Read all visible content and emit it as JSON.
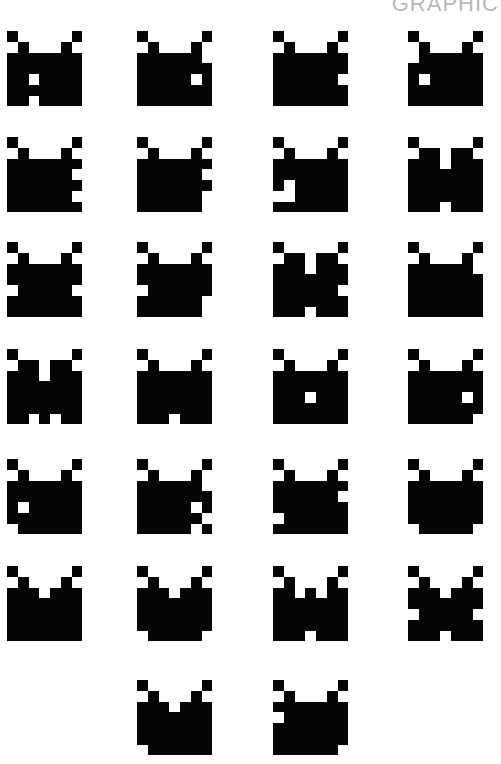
{
  "header": {
    "label": "GRAPHIC"
  },
  "colors": {
    "ink": "#050505",
    "background": "#ffffff",
    "label": "#b8b8b8"
  },
  "grid": {
    "cell_px": 10.75,
    "cols_x": [
      7,
      137,
      273,
      408
    ],
    "rows_y": [
      31,
      137,
      242,
      349,
      459,
      566,
      680
    ]
  },
  "sprites": [
    {
      "row": 0,
      "col": 0,
      "pattern": [
        "#.....#",
        ".#...#.",
        "#######",
        "#######",
        "##.####",
        "#######",
        "##.####"
      ]
    },
    {
      "row": 0,
      "col": 1,
      "pattern": [
        "#.....#",
        ".#...#.",
        "######.",
        "#######",
        "#####.#",
        "#######",
        "#######"
      ]
    },
    {
      "row": 0,
      "col": 2,
      "pattern": [
        "#.....#",
        ".#...#.",
        "#######",
        "#######",
        "######.",
        "#######",
        "#######"
      ]
    },
    {
      "row": 0,
      "col": 3,
      "pattern": [
        "#.....#",
        ".#...#.",
        ".######",
        "#######",
        "#.#####",
        "#######",
        "#######"
      ]
    },
    {
      "row": 1,
      "col": 0,
      "pattern": [
        "#.....#",
        ".#...#.",
        "#######",
        "######.",
        "#######",
        "######.",
        "#######"
      ]
    },
    {
      "row": 1,
      "col": 1,
      "pattern": [
        "#.....#",
        ".#...#.",
        "#######",
        "######.",
        "#######",
        "######.",
        "######."
      ]
    },
    {
      "row": 1,
      "col": 2,
      "pattern": [
        "#.....#",
        ".#...#.",
        "#######",
        "#######",
        "#.#####",
        "..#####",
        "#######"
      ]
    },
    {
      "row": 1,
      "col": 3,
      "pattern": [
        "#.....#",
        ".##.##.",
        "###.###",
        "#######",
        "#######",
        "#######",
        "###.###"
      ]
    },
    {
      "row": 2,
      "col": 0,
      "pattern": [
        "#.....#",
        ".#...#.",
        "#######",
        "#######",
        ".#####.",
        "#######",
        "#######"
      ]
    },
    {
      "row": 2,
      "col": 1,
      "pattern": [
        "#.....#",
        ".#...#.",
        "#######",
        "#######",
        ".######",
        "######.",
        "######."
      ]
    },
    {
      "row": 2,
      "col": 2,
      "pattern": [
        "#.....#",
        ".##.##.",
        "###.###",
        "#######",
        "######.",
        "#######",
        "###.###"
      ]
    },
    {
      "row": 2,
      "col": 3,
      "pattern": [
        "#.....#",
        ".#...#.",
        "######.",
        "#######",
        "#######",
        "#######",
        "#######"
      ]
    },
    {
      "row": 3,
      "col": 0,
      "pattern": [
        "#.....#",
        ".##.##.",
        "###.###",
        "#######",
        "#######",
        "#######",
        "##.#.##"
      ]
    },
    {
      "row": 3,
      "col": 1,
      "pattern": [
        "#.....#",
        ".#...#.",
        "#######",
        "#######",
        "#######",
        "#######",
        "###.###"
      ]
    },
    {
      "row": 3,
      "col": 2,
      "pattern": [
        "#.....#",
        ".#...#.",
        "#######",
        "#######",
        "###.###",
        "#######",
        "#######"
      ]
    },
    {
      "row": 3,
      "col": 3,
      "pattern": [
        "#.....#",
        ".#...#.",
        "#######",
        "#######",
        "#####.#",
        "#######",
        "######."
      ]
    },
    {
      "row": 4,
      "col": 0,
      "pattern": [
        "#.....#",
        ".#...#.",
        "#######",
        "#######",
        "#.#####",
        "#######",
        ".######"
      ]
    },
    {
      "row": 4,
      "col": 1,
      "pattern": [
        "#.....#",
        ".#...#.",
        "######.",
        "#######",
        "#####.#",
        "######.",
        "#####.#"
      ]
    },
    {
      "row": 4,
      "col": 2,
      "pattern": [
        "#.....#",
        ".#...#.",
        "#######",
        "######.",
        "#######",
        ".######",
        "#######"
      ]
    },
    {
      "row": 4,
      "col": 3,
      "pattern": [
        "#.....#",
        ".#...#.",
        "#######",
        "#######",
        "#######",
        "#######",
        ".#####."
      ]
    },
    {
      "row": 5,
      "col": 0,
      "pattern": [
        "#.....#",
        ".#...#.",
        "###.###",
        "#######",
        "#######",
        "#######",
        "#######"
      ]
    },
    {
      "row": 5,
      "col": 1,
      "pattern": [
        "#.....#",
        ".#...#.",
        "###.###",
        "#######",
        "#######",
        "#######",
        ".#####."
      ]
    },
    {
      "row": 5,
      "col": 2,
      "pattern": [
        "#.....#",
        ".#...#.",
        "##.#.##",
        "#######",
        "#######",
        "#######",
        "###.###"
      ]
    },
    {
      "row": 5,
      "col": 3,
      "pattern": [
        "#.....#",
        ".#...#.",
        "###.###",
        "#######",
        ".#####.",
        "#######",
        "###.###"
      ]
    },
    {
      "row": 6,
      "col": 1,
      "pattern": [
        "#.....#",
        ".#...#.",
        "###.###",
        "#######",
        "#######",
        "#######",
        ".######"
      ]
    },
    {
      "row": 6,
      "col": 2,
      "pattern": [
        "#.....#",
        ".#...#.",
        "#######",
        ".######",
        "#######",
        "#######",
        "######."
      ]
    }
  ]
}
